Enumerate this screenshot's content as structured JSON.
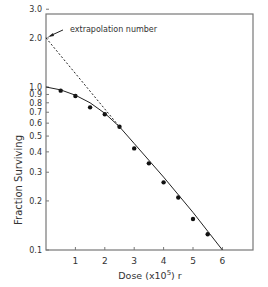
{
  "chart_data": {
    "type": "scatter",
    "title": "",
    "xlabel": "Dose (x10^5) r",
    "xlabel_parts": {
      "main": "Dose  (x10",
      "sup": "5",
      "tail": ") r"
    },
    "ylabel": "Fraction Surviving",
    "yscale": "log",
    "xlim": [
      0,
      7
    ],
    "ylim": [
      0.1,
      3.0
    ],
    "x_ticks": [
      1,
      2,
      3,
      4,
      5,
      6
    ],
    "y_ticks": [
      0.1,
      0.2,
      0.3,
      0.4,
      0.5,
      0.6,
      0.7,
      0.8,
      0.9,
      1.0,
      2.0,
      3.0
    ],
    "y_tick_labels": [
      "0.1",
      "0.2",
      "0.3",
      "0.4",
      "0.5",
      "0.6",
      "0.7",
      "0.8",
      "0.9",
      "1.0",
      "2.0",
      "3.0"
    ],
    "series": [
      {
        "name": "measured",
        "type": "scatter",
        "x": [
          0.5,
          1.0,
          1.5,
          2.0,
          2.5,
          3.0,
          3.5,
          4.0,
          4.5,
          5.0,
          5.5
        ],
        "y": [
          0.95,
          0.88,
          0.75,
          0.68,
          0.57,
          0.42,
          0.34,
          0.26,
          0.21,
          0.155,
          0.125
        ]
      },
      {
        "name": "fit curve",
        "type": "line",
        "x": [
          0,
          0.5,
          1.0,
          1.5,
          2.0,
          2.5,
          3.0,
          4.0,
          5.0,
          6.0
        ],
        "y": [
          1.0,
          0.96,
          0.89,
          0.8,
          0.69,
          0.57,
          0.45,
          0.28,
          0.17,
          0.1
        ]
      },
      {
        "name": "extrapolation",
        "type": "line",
        "style": "dashed",
        "x": [
          0,
          2.5
        ],
        "y": [
          2.0,
          0.57
        ]
      }
    ],
    "annotations": [
      {
        "text": "extrapolation number",
        "x": 0,
        "y": 2.0
      }
    ],
    "grid": false,
    "legend": "none"
  }
}
